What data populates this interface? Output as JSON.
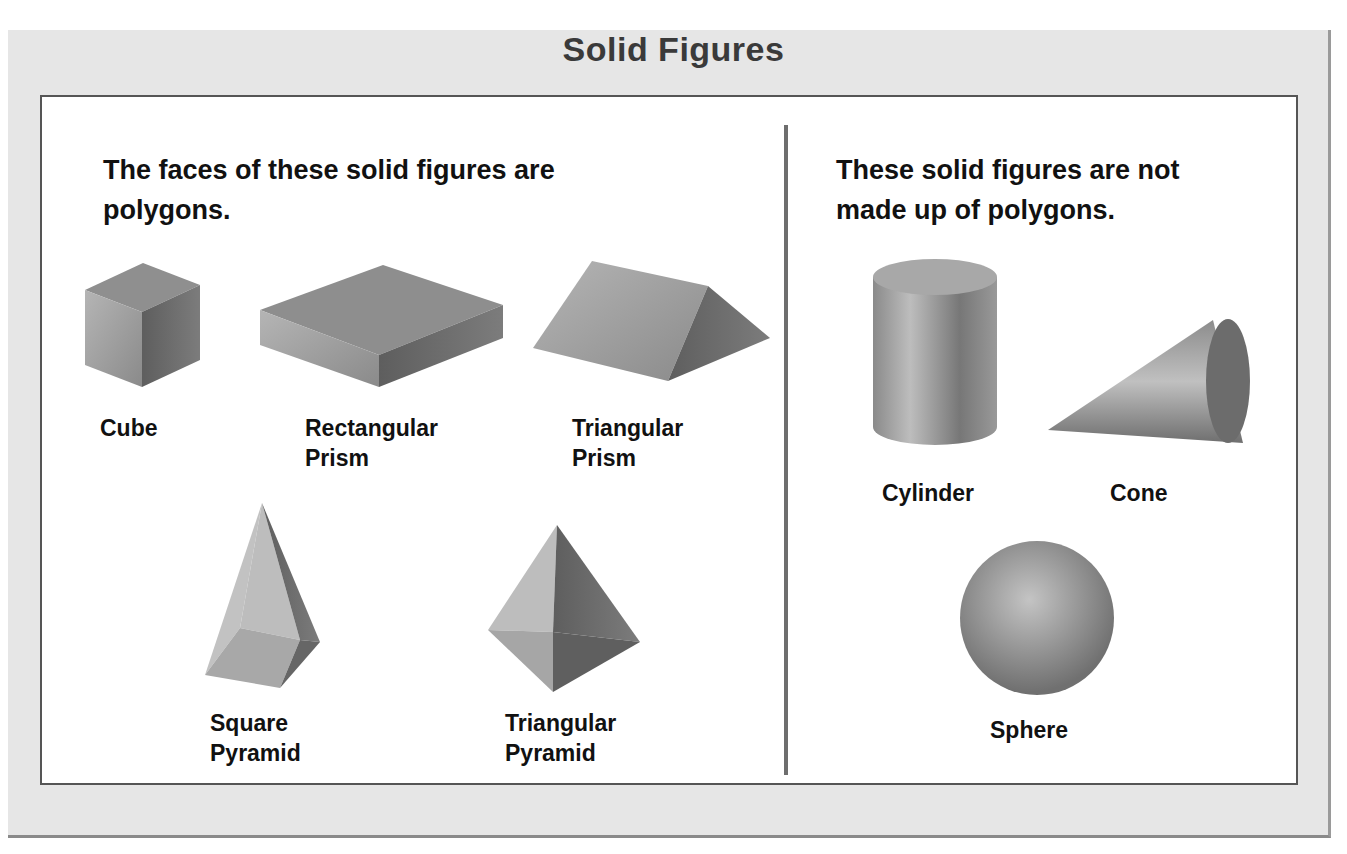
{
  "title": "Solid Figures",
  "left_panel": {
    "heading_line1": "The faces of these solid figures are",
    "heading_line2": "polygons.",
    "figures": [
      {
        "name": "cube",
        "label_line1": "Cube",
        "label_line2": ""
      },
      {
        "name": "rectangular-prism",
        "label_line1": "Rectangular",
        "label_line2": "Prism"
      },
      {
        "name": "triangular-prism",
        "label_line1": "Triangular",
        "label_line2": "Prism"
      },
      {
        "name": "square-pyramid",
        "label_line1": "Square",
        "label_line2": "Pyramid"
      },
      {
        "name": "triangular-pyramid",
        "label_line1": "Triangular",
        "label_line2": "Pyramid"
      }
    ]
  },
  "right_panel": {
    "heading_line1": "These solid figures are not",
    "heading_line2": "made up of polygons.",
    "figures": [
      {
        "name": "cylinder",
        "label_line1": "Cylinder"
      },
      {
        "name": "cone",
        "label_line1": "Cone"
      },
      {
        "name": "sphere",
        "label_line1": "Sphere"
      }
    ]
  }
}
